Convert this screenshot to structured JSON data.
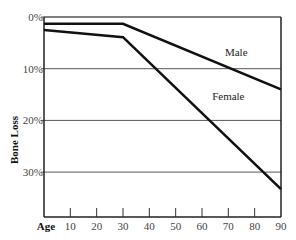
{
  "chart_data": {
    "type": "line",
    "title": "",
    "xlabel": "Age",
    "ylabel": "Bone Loss",
    "x_ticks": [
      10,
      20,
      30,
      40,
      50,
      60,
      70,
      80,
      90
    ],
    "y_ticks": [
      "0%",
      "10%",
      "20%",
      "30%"
    ],
    "xlim": [
      0,
      90
    ],
    "ylim": [
      0,
      37.5
    ],
    "y_inverted": true,
    "grid": {
      "horizontal": true,
      "vertical": false
    },
    "series": [
      {
        "name": "Male",
        "x": [
          0,
          30,
          90
        ],
        "values": [
          1.3,
          1.3,
          14
        ]
      },
      {
        "name": "Female",
        "x": [
          0,
          30,
          90
        ],
        "values": [
          2.5,
          3.9,
          33.3
        ]
      }
    ],
    "annotations": [
      {
        "text": "Male",
        "x": 73,
        "y": 7.5
      },
      {
        "text": "Female",
        "x": 70,
        "y": 16
      }
    ]
  }
}
